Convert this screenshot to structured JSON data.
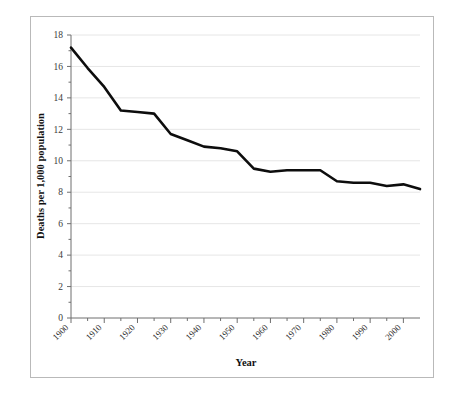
{
  "chart_data": {
    "type": "line",
    "title": "",
    "xlabel": "Year",
    "ylabel": "Deaths per 1,000 population",
    "xlim": [
      1900,
      2005
    ],
    "ylim": [
      0,
      18
    ],
    "grid": true,
    "legend": null,
    "x_tick_labels": [
      "1900",
      "1910",
      "1920",
      "1930",
      "1940",
      "1950",
      "1960",
      "1970",
      "1980",
      "1990",
      "2000"
    ],
    "x_tick_values": [
      1900,
      1910,
      1920,
      1930,
      1940,
      1950,
      1960,
      1970,
      1980,
      1990,
      2000
    ],
    "y_tick_labels": [
      "0",
      "2",
      "4",
      "6",
      "8",
      "10",
      "12",
      "14",
      "16",
      "18"
    ],
    "y_tick_values": [
      0,
      2,
      4,
      6,
      8,
      10,
      12,
      14,
      16,
      18
    ],
    "series": [
      {
        "name": "Death rate",
        "color": "#0d0d0d",
        "x": [
          1900,
          1905,
          1910,
          1915,
          1920,
          1925,
          1930,
          1935,
          1940,
          1945,
          1950,
          1955,
          1960,
          1965,
          1970,
          1975,
          1980,
          1985,
          1990,
          1995,
          2000,
          2005
        ],
        "values": [
          17.2,
          15.9,
          14.7,
          13.2,
          13.1,
          13.0,
          11.7,
          11.3,
          10.9,
          10.8,
          10.6,
          9.5,
          9.3,
          9.4,
          9.4,
          9.4,
          8.7,
          8.6,
          8.6,
          8.4,
          8.5,
          8.2
        ]
      }
    ]
  },
  "axes": {
    "x_title": "Year",
    "y_title": "Deaths per 1,000 population"
  }
}
